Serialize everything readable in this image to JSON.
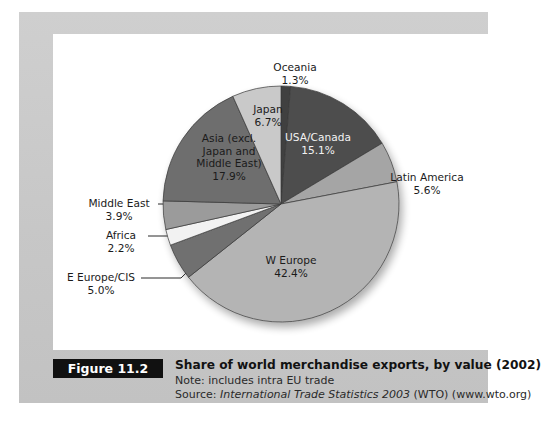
{
  "figure": {
    "badge": "Figure 11.2",
    "title": "Share of world merchandise exports, by value (2002)",
    "note": "Note: includes intra EU trade",
    "source_prefix": "Source: ",
    "source_italic": "International Trade Statistics 2003",
    "source_suffix": " (WTO) (www.wto.org)"
  },
  "chart_data": {
    "type": "pie",
    "title": "Share of world merchandise exports, by value (2002)",
    "unit": "%",
    "start_angle_deg": 0,
    "direction": "clockwise",
    "legend": "none",
    "grid": false,
    "categories": [
      "Oceania",
      "USA/Canada",
      "Latin America",
      "W Europe",
      "E Europe/CIS",
      "Africa",
      "Middle East",
      "Asia (excl. Japan and Middle East)",
      "Japan"
    ],
    "values": [
      1.3,
      15.1,
      5.6,
      42.4,
      5.0,
      2.2,
      3.9,
      17.9,
      6.7
    ],
    "labels": [
      "Oceania\n1.3%",
      "USA/Canada\n15.1%",
      "Latin America\n5.6%",
      "W Europe\n42.4%",
      "E Europe/CIS\n5.0%",
      "Africa\n2.2%",
      "Middle East\n3.9%",
      "Asia (excl.\nJapan and\nMiddle East)\n17.9%",
      "Japan\n6.7%"
    ],
    "slice_colors": [
      "#3f3f3f",
      "#4d4d4d",
      "#a5a5a5",
      "#b4b4b4",
      "#6f6f6f",
      "#f2f2f2",
      "#9b9b9b",
      "#6e6e6e",
      "#c9c9c9"
    ],
    "label_text": {
      "oceania": "Oceania",
      "oceania_pct": "1.3%",
      "japan": "Japan",
      "japan_pct": "6.7%",
      "usa_canada": "USA/Canada",
      "usa_canada_pct": "15.1%",
      "latin_america": "Latin America",
      "latin_america_pct": "5.6%",
      "w_europe": "W Europe",
      "w_europe_pct": "42.4%",
      "e_europe": "E Europe/CIS",
      "e_europe_pct": "5.0%",
      "africa": "Africa",
      "africa_pct": "2.2%",
      "middle_east": "Middle East",
      "middle_east_pct": "3.9%",
      "asia_l1": "Asia (excl.",
      "asia_l2": "Japan and",
      "asia_l3": "Middle East)",
      "asia_pct": "17.9%"
    }
  },
  "colors": {
    "panel_bg": "#c9c9c9",
    "chart_bg": "#ffffff",
    "badge_bg": "#111111",
    "badge_fg": "#ffffff",
    "text": "#1a1a1a"
  }
}
